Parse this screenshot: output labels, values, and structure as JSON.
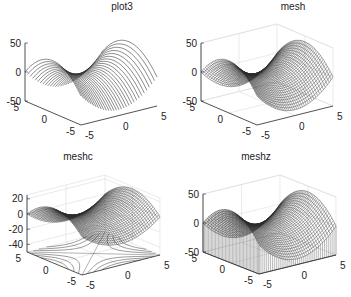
{
  "figure": {
    "width": 351,
    "height": 297,
    "background": "#ffffff",
    "axis_color": "#262626",
    "grid_color": "#dcdcdc",
    "line_color": "#2a2a2a"
  },
  "panels": [
    {
      "id": "plot3",
      "title": "plot3",
      "grid": false
    },
    {
      "id": "mesh",
      "title": "mesh",
      "grid": true
    },
    {
      "id": "meshc",
      "title": "meshc",
      "grid": true
    },
    {
      "id": "meshz",
      "title": "meshz",
      "grid": true
    }
  ],
  "chart_data": [
    {
      "type": "line",
      "subtype": "3d-plot3",
      "title": "plot3",
      "xlabel": "",
      "ylabel": "",
      "zlabel": "",
      "x_ticks": [
        "-5",
        "0",
        "5"
      ],
      "y_ticks": [
        "-5",
        "0",
        "5"
      ],
      "z_ticks": [
        "-50",
        "0",
        "50"
      ],
      "xlim": [
        -5,
        5
      ],
      "ylim": [
        -5,
        5
      ],
      "zlim": [
        -50,
        50
      ],
      "grid": false,
      "description": "Saddle surface drawn as parallel 3D lines; z rises to ~+40 at far right, dips to ~-45 in front"
    },
    {
      "type": "surface",
      "subtype": "3d-mesh",
      "title": "mesh",
      "x_ticks": [
        "-5",
        "0",
        "5"
      ],
      "y_ticks": [
        "-5",
        "0",
        "5"
      ],
      "z_ticks": [
        "-50",
        "0",
        "50"
      ],
      "xlim": [
        -5,
        5
      ],
      "ylim": [
        -5,
        5
      ],
      "zlim": [
        -50,
        50
      ],
      "grid": true
    },
    {
      "type": "surface",
      "subtype": "3d-meshc",
      "title": "meshc",
      "x_ticks": [
        "-5",
        "0",
        "5"
      ],
      "y_ticks": [
        "-5",
        "0",
        "5"
      ],
      "z_ticks": [
        "-40",
        "-20",
        "0",
        "20"
      ],
      "xlim": [
        -5,
        5
      ],
      "ylim": [
        -5,
        5
      ],
      "zlim": [
        -50,
        25
      ],
      "grid": true,
      "contour": "hyperbolic contour lines projected on floor"
    },
    {
      "type": "surface",
      "subtype": "3d-meshz",
      "title": "meshz",
      "x_ticks": [
        "-5",
        "0",
        "5"
      ],
      "y_ticks": [
        "-5",
        "0",
        "5"
      ],
      "z_ticks": [
        "-50",
        "0",
        "50"
      ],
      "xlim": [
        -5,
        5
      ],
      "ylim": [
        -5,
        5
      ],
      "zlim": [
        -50,
        50
      ],
      "grid": true,
      "curtain": "vertical reference curtain down to z=-50"
    }
  ]
}
